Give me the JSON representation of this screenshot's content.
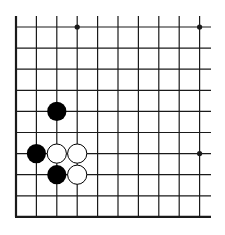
{
  "diagram": {
    "type": "go-board-fragment",
    "colors": {
      "line": "#1a1a1a",
      "black_stone": "#000000",
      "white_stone": "#ffffff",
      "background": "#ffffff"
    },
    "grid": {
      "x0": 16,
      "col_spacing": 20.4,
      "cols": 10,
      "right_extent": 211,
      "y0": 27,
      "row_spacing": 21.1,
      "rows": 10,
      "top_extent": 16,
      "left_edge_thick": true,
      "bottom_edge_thick": true
    },
    "star_points": [
      {
        "col": 3,
        "row": 0
      },
      {
        "col": 9,
        "row": 0
      },
      {
        "col": 9,
        "row": 6
      }
    ],
    "stones": [
      {
        "color": "black",
        "col": 2,
        "row": 4
      },
      {
        "color": "black",
        "col": 1,
        "row": 6
      },
      {
        "color": "white",
        "col": 2,
        "row": 6
      },
      {
        "color": "white",
        "col": 3,
        "row": 6
      },
      {
        "color": "black",
        "col": 2,
        "row": 7
      },
      {
        "color": "white",
        "col": 3,
        "row": 7
      }
    ]
  }
}
